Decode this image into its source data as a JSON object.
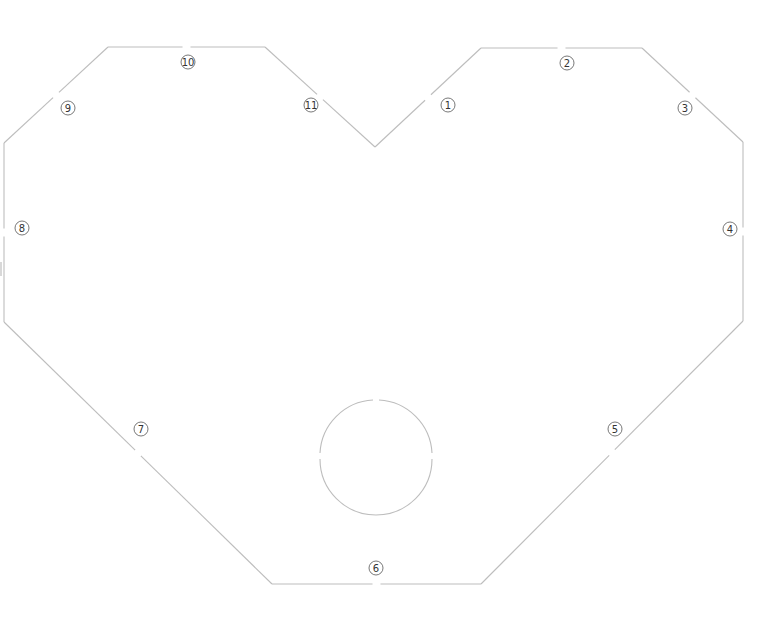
{
  "diagram": {
    "title": "",
    "shape": "heart-outline",
    "stroke_color": "#bdbdbd",
    "label_color": "#333333",
    "edges": [
      {
        "id": "edge-1",
        "label": "1"
      },
      {
        "id": "edge-2",
        "label": "2"
      },
      {
        "id": "edge-3",
        "label": "3"
      },
      {
        "id": "edge-4",
        "label": "4"
      },
      {
        "id": "edge-5",
        "label": "5"
      },
      {
        "id": "edge-6",
        "label": "6"
      },
      {
        "id": "edge-7",
        "label": "7"
      },
      {
        "id": "edge-8",
        "label": "8"
      },
      {
        "id": "edge-9",
        "label": "9"
      },
      {
        "id": "edge-10",
        "label": "10"
      },
      {
        "id": "edge-11",
        "label": "11"
      }
    ],
    "hole": {
      "shape": "circle"
    }
  }
}
